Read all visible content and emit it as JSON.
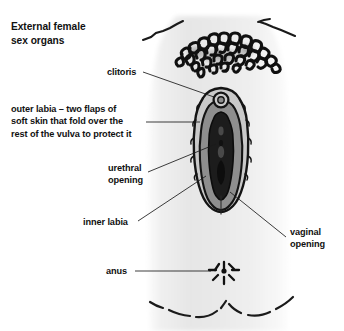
{
  "figure": {
    "title": "External female\nsex organs",
    "background_color": "#ffffff",
    "ink_color": "#111111"
  },
  "labels": [
    {
      "id": "clitoris",
      "text": "clitoris",
      "leader": true
    },
    {
      "id": "outer-labia",
      "text": "outer labia – two flaps of\nsoft skin that fold over the\nrest of the vulva to protect it",
      "leader": true
    },
    {
      "id": "urethral-opening",
      "text": "urethral\nopening",
      "leader": true
    },
    {
      "id": "inner-labia",
      "text": "inner labia",
      "leader": true
    },
    {
      "id": "vaginal-opening",
      "text": "vaginal\nopening",
      "leader": true
    },
    {
      "id": "anus",
      "text": "anus",
      "leader": true
    }
  ],
  "illustration": {
    "name": "vulva-anatomy-drawing",
    "body_fill_light": "#f3f3f3",
    "body_fill_mid": "#e2e2e2",
    "outer_labia_fill": "#c9c9c9",
    "inner_labia_fill": "#8e8e8e",
    "vestibule_fill": "#1c1c1c",
    "hair_color": "#101010",
    "outline_color": "#141414",
    "parts": [
      "pubic-hair",
      "mons-pubis",
      "outer-labia",
      "inner-labia",
      "clitoris",
      "urethral-opening",
      "vaginal-opening",
      "anus",
      "thighs"
    ]
  }
}
